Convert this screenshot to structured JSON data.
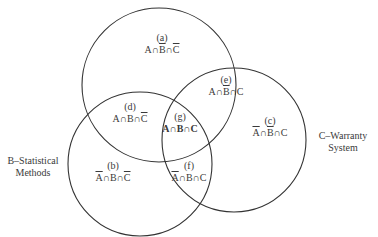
{
  "diagram": {
    "type": "venn",
    "sets": [
      {
        "id": "A",
        "label": "",
        "cx": 159,
        "cy": 85,
        "r": 77
      },
      {
        "id": "B",
        "label": "B–Statistical Methods",
        "label_lines": [
          "B–Statistical",
          "Methods"
        ],
        "cx": 140,
        "cy": 164,
        "r": 72
      },
      {
        "id": "C",
        "label": "C–Warranty System",
        "label_lines": [
          "C–Warranty",
          "System"
        ],
        "cx": 234,
        "cy": 140,
        "r": 72
      }
    ],
    "stroke_color": "#333333",
    "regions": [
      {
        "id": "a",
        "tag": "(a)",
        "parts": [
          {
            "t": "A",
            "o": false
          },
          {
            "t": "∩",
            "o": false
          },
          {
            "t": "B",
            "o": true
          },
          {
            "t": "∩",
            "o": false
          },
          {
            "t": "C",
            "o": true
          }
        ]
      },
      {
        "id": "b",
        "tag": "(b)",
        "parts": [
          {
            "t": "A",
            "o": true
          },
          {
            "t": "∩",
            "o": false
          },
          {
            "t": "B",
            "o": false
          },
          {
            "t": "∩",
            "o": false
          },
          {
            "t": "C",
            "o": true
          }
        ]
      },
      {
        "id": "c",
        "tag": "(c)",
        "parts": [
          {
            "t": "A",
            "o": true
          },
          {
            "t": "∩",
            "o": false
          },
          {
            "t": "B",
            "o": true
          },
          {
            "t": "∩",
            "o": false
          },
          {
            "t": "C",
            "o": false
          }
        ]
      },
      {
        "id": "d",
        "tag": "(d)",
        "parts": [
          {
            "t": "A",
            "o": false
          },
          {
            "t": "∩",
            "o": false
          },
          {
            "t": "B",
            "o": false
          },
          {
            "t": "∩",
            "o": false
          },
          {
            "t": "C",
            "o": true
          }
        ]
      },
      {
        "id": "e",
        "tag": "(e)",
        "parts": [
          {
            "t": "A",
            "o": false
          },
          {
            "t": "∩",
            "o": false
          },
          {
            "t": "B",
            "o": true
          },
          {
            "t": "∩",
            "o": false
          },
          {
            "t": "C",
            "o": false
          }
        ]
      },
      {
        "id": "f",
        "tag": "(f)",
        "parts": [
          {
            "t": "A",
            "o": true
          },
          {
            "t": "∩",
            "o": false
          },
          {
            "t": "B",
            "o": false
          },
          {
            "t": "∩",
            "o": false
          },
          {
            "t": "C",
            "o": false
          }
        ]
      },
      {
        "id": "g",
        "tag": "(g)",
        "bold": true,
        "parts": [
          {
            "t": "A",
            "o": false
          },
          {
            "t": "∩",
            "o": false
          },
          {
            "t": "B",
            "o": false
          },
          {
            "t": "∩",
            "o": false
          },
          {
            "t": "C",
            "o": false
          }
        ]
      }
    ]
  }
}
